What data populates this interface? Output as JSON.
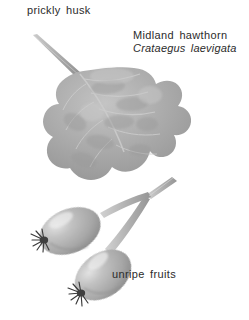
{
  "plate": {
    "kind": "botanical-illustration",
    "subject": "Midland hawthorn leaf and unripe fruits",
    "background_color": "#ffffff",
    "text_color": "#2b2b2b"
  },
  "labels": {
    "prickly_husk": "prickly husk",
    "common_name": "Midland hawthorn",
    "scientific_name": "Crataegus laevigata",
    "unripe_fruits": "unripe fruits"
  },
  "specimen": {
    "leaf": {
      "name": "lobed hawthorn leaf",
      "fill_color": "#a9a9a9",
      "highlight_color": "#c9c9c9",
      "shadow_color": "#8e8e8e"
    },
    "petiole": {
      "name": "leaf stalk",
      "color": "#b4b4b4"
    },
    "fruits": [
      {
        "name": "upper unripe fruit",
        "body_color": "#b0b0b0",
        "highlight_color": "#dedede",
        "calyx_color": "#3a3a3a"
      },
      {
        "name": "lower unripe fruit",
        "body_color": "#b0b0b0",
        "highlight_color": "#dedede",
        "calyx_color": "#3a3a3a"
      }
    ],
    "fruit_stalk": {
      "name": "forked fruit stalk",
      "color": "#b8b8b8"
    }
  }
}
